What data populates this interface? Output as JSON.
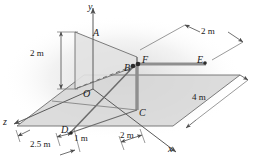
{
  "figure": {
    "type": "engineering-statics-3d-diagram",
    "background_color": "#ffffff",
    "line_color": "#6b6b6b",
    "dark_line_color": "#555555",
    "member_color": "#8c8c8c",
    "plane_fill_ground": "#d9d9d9",
    "plane_fill_wall": "#e0e0e0",
    "text_color": "#1a1a1a"
  },
  "axes": [
    {
      "id": "y",
      "label": "y"
    },
    {
      "id": "x",
      "label": "x"
    },
    {
      "id": "z",
      "label": "z"
    }
  ],
  "points": [
    {
      "id": "A",
      "label": "A"
    },
    {
      "id": "B",
      "label": "B"
    },
    {
      "id": "C",
      "label": "C"
    },
    {
      "id": "D",
      "label": "D"
    },
    {
      "id": "E",
      "label": "E"
    },
    {
      "id": "F",
      "label": "F"
    },
    {
      "id": "O",
      "label": "O"
    }
  ],
  "dimensions": [
    {
      "id": "vertical-OA",
      "label": "2 m"
    },
    {
      "id": "beam-FE",
      "label": "2 m"
    },
    {
      "id": "ground-depth",
      "label": "4 m"
    },
    {
      "id": "ground-x",
      "label": "2 m"
    },
    {
      "id": "ground-z-far",
      "label": "2.5 m"
    },
    {
      "id": "ground-z-near",
      "label": "1 m"
    }
  ]
}
